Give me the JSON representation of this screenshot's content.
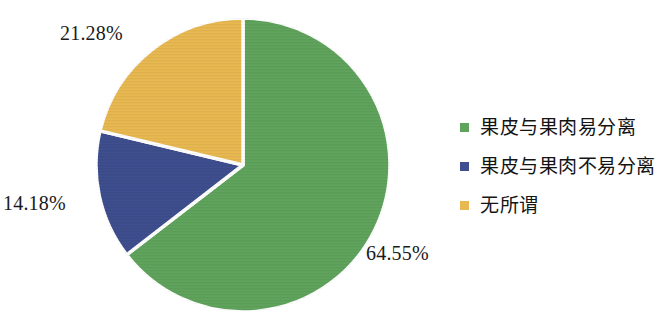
{
  "chart_data": {
    "type": "pie",
    "title": "",
    "labels": [
      "果皮与果肉易分离",
      "果皮与果肉不易分离",
      "无所谓"
    ],
    "values": [
      64.55,
      14.18,
      21.28
    ],
    "value_labels": [
      "64.55%",
      "14.18%",
      "21.28%"
    ],
    "colors": [
      "#5FA35C",
      "#3E4E8E",
      "#E8B851"
    ],
    "units": "%",
    "legend_position": "right",
    "start_angle_deg": 0,
    "direction": "clockwise",
    "slice_gap": true,
    "grid": false
  },
  "labels": {
    "green_pct": "64.55%",
    "blue_pct": "14.18%",
    "gold_pct": "21.28%"
  },
  "legend": {
    "items": [
      {
        "label": "果皮与果肉易分离",
        "color": "#5FA35C"
      },
      {
        "label": "果皮与果肉不易分离",
        "color": "#3E4E8E"
      },
      {
        "label": "无所谓",
        "color": "#E8B851"
      }
    ]
  }
}
